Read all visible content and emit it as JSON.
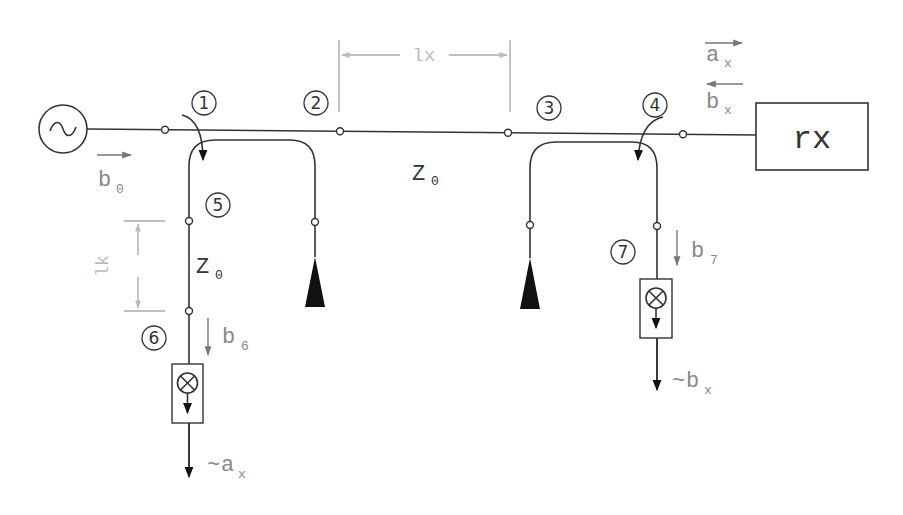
{
  "diagram": {
    "title": "",
    "source": {
      "symbol": "~",
      "label": "signal-source"
    },
    "receiver": {
      "label": "rx"
    },
    "port_labels": [
      "1",
      "2",
      "3",
      "4",
      "5",
      "6",
      "7"
    ],
    "line_impedance_main": {
      "main": "Z",
      "sub": "0"
    },
    "line_impedance_branch": {
      "main": "Z",
      "sub": "0"
    },
    "dimension_main": "lx",
    "dimension_branch": "lk",
    "waves": {
      "b0": {
        "main": "b",
        "sub": "0"
      },
      "ax": {
        "main": "a",
        "sub": "x"
      },
      "bx": {
        "main": "b",
        "sub": "x"
      },
      "b6": {
        "main": "b",
        "sub": "6"
      },
      "b7": {
        "main": "b",
        "sub": "7"
      }
    },
    "outputs": {
      "left": {
        "prefix": "~",
        "main": "a",
        "sub": "x"
      },
      "right": {
        "prefix": "~",
        "main": "b",
        "sub": "x"
      }
    },
    "mixer_symbol": "⊗",
    "colors": {
      "line": "#333333",
      "dimension": "#aaaaaa",
      "wave_arrow": "#777777"
    }
  }
}
